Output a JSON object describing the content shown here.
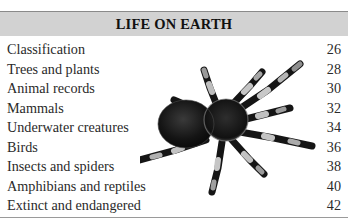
{
  "toc": {
    "title": "LIFE ON EARTH",
    "entries": [
      {
        "label": "Classification",
        "page": "26"
      },
      {
        "label": "Trees and plants",
        "page": "28"
      },
      {
        "label": "Animal records",
        "page": "30"
      },
      {
        "label": "Mammals",
        "page": "32"
      },
      {
        "label": "Underwater creatures",
        "page": "34"
      },
      {
        "label": "Birds",
        "page": "36"
      },
      {
        "label": "Insects and spiders",
        "page": "38"
      },
      {
        "label": "Amphibians and reptiles",
        "page": "40"
      },
      {
        "label": "Extinct and endangered",
        "page": "42"
      }
    ]
  },
  "illustration": {
    "subject": "tarantula-photo",
    "style": "black-and-white"
  },
  "colors": {
    "header_band": "#d2d2d2",
    "text": "#2a2a2a",
    "title": "#111111",
    "background": "#ffffff"
  }
}
